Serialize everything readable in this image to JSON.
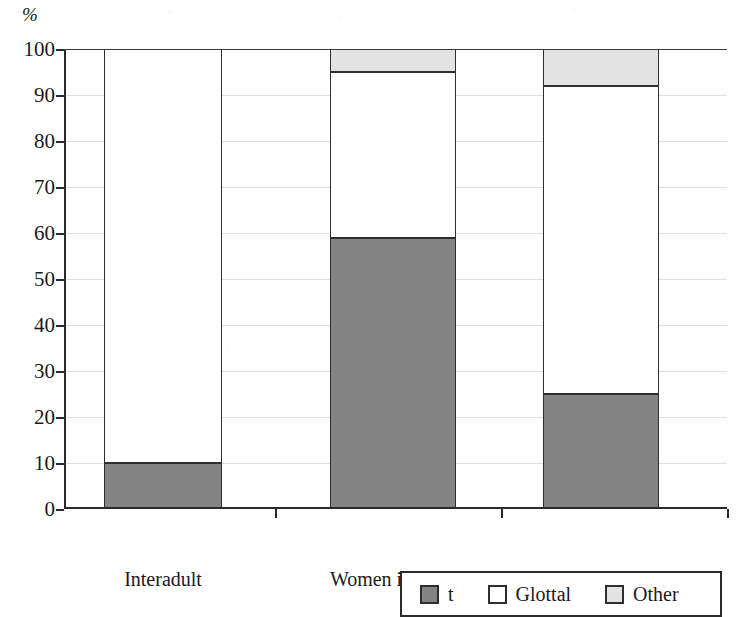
{
  "axis": {
    "unit_label": "%",
    "y_ticks": [
      0,
      10,
      20,
      30,
      40,
      50,
      60,
      70,
      80,
      90,
      100
    ],
    "y_min": 0,
    "y_max": 100
  },
  "legend": {
    "items": [
      {
        "label": "t",
        "color": "#848484",
        "swatch": "dark-gray-swatch"
      },
      {
        "label": "Glottal",
        "color": "#ffffff",
        "swatch": "white-swatch"
      },
      {
        "label": "Other",
        "color": "#e3e3e3",
        "swatch": "light-gray-swatch"
      }
    ]
  },
  "chart_data": {
    "type": "bar",
    "title": "",
    "xlabel": "",
    "ylabel": "%",
    "ylim": [
      0,
      100
    ],
    "grid": true,
    "stacked": true,
    "normalized_percent": true,
    "legend_position": "bottom-right",
    "categories": [
      "Interadult",
      "Women in CDS",
      "Men in CDS"
    ],
    "series": [
      {
        "name": "t",
        "color": "#848484",
        "values": [
          10,
          59,
          25
        ]
      },
      {
        "name": "Glottal",
        "color": "#ffffff",
        "values": [
          90,
          36,
          67
        ]
      },
      {
        "name": "Other",
        "color": "#e3e3e3",
        "values": [
          0,
          5,
          8
        ]
      }
    ],
    "tick_labels": {
      "y": [
        "0",
        "10",
        "20",
        "30",
        "40",
        "50",
        "60",
        "70",
        "80",
        "90",
        "100"
      ],
      "x": [
        "Interadult",
        "Women in CDS",
        "Men in CDS"
      ]
    }
  }
}
